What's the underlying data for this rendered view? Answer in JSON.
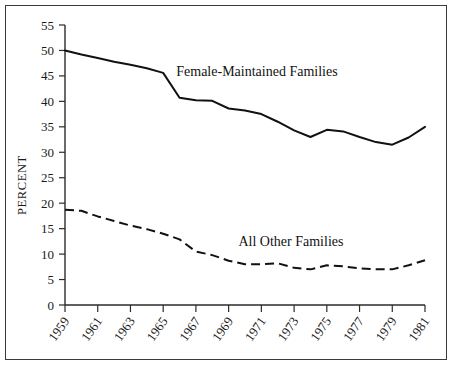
{
  "chart_data": {
    "type": "line",
    "title": "",
    "subtitle": "",
    "xlabel": "",
    "ylabel": "PERCENT",
    "xlim": [
      1959,
      1981
    ],
    "ylim": [
      0,
      55
    ],
    "grid": false,
    "legend_position": "inline-annotation",
    "x": [
      1959,
      1960,
      1961,
      1962,
      1963,
      1964,
      1965,
      1966,
      1967,
      1968,
      1969,
      1970,
      1971,
      1972,
      1973,
      1974,
      1975,
      1976,
      1977,
      1978,
      1979,
      1980,
      1981
    ],
    "xticks": [
      1959,
      1961,
      1963,
      1965,
      1967,
      1969,
      1971,
      1973,
      1975,
      1977,
      1979,
      1981
    ],
    "xticklabels": [
      "1959",
      "1961",
      "1963",
      "1965",
      "1967",
      "1969",
      "1971",
      "1973",
      "1975",
      "1977",
      "1979",
      "1981"
    ],
    "yticks": [
      0,
      5,
      10,
      15,
      20,
      25,
      30,
      35,
      40,
      45,
      50,
      55
    ],
    "yticklabels": [
      "0",
      "5",
      "10",
      "15",
      "20",
      "25",
      "30",
      "35",
      "40",
      "45",
      "50",
      "55"
    ],
    "series": [
      {
        "name": "Female-Maintained Families",
        "style": "solid",
        "label_x": 1965.8,
        "label_y": 45.0,
        "values": [
          50.0,
          49.2,
          48.5,
          47.8,
          47.2,
          46.5,
          45.6,
          40.7,
          40.2,
          40.1,
          38.6,
          38.2,
          37.5,
          36.0,
          34.3,
          33.0,
          34.4,
          34.1,
          33.0,
          32.0,
          31.5,
          32.9,
          35.0
        ]
      },
      {
        "name": "All Other Families",
        "style": "dashed",
        "label_x": 1969.6,
        "label_y": 11.6,
        "values": [
          18.7,
          18.5,
          17.4,
          16.5,
          15.6,
          14.9,
          14.0,
          12.9,
          10.5,
          9.8,
          8.7,
          8.0,
          8.0,
          8.2,
          7.3,
          7.0,
          7.8,
          7.6,
          7.2,
          7.0,
          7.0,
          7.8,
          8.8
        ]
      }
    ]
  },
  "figure": {
    "frame_color": "#3b3b3b",
    "line_color": "#111111",
    "background": "#ffffff"
  }
}
